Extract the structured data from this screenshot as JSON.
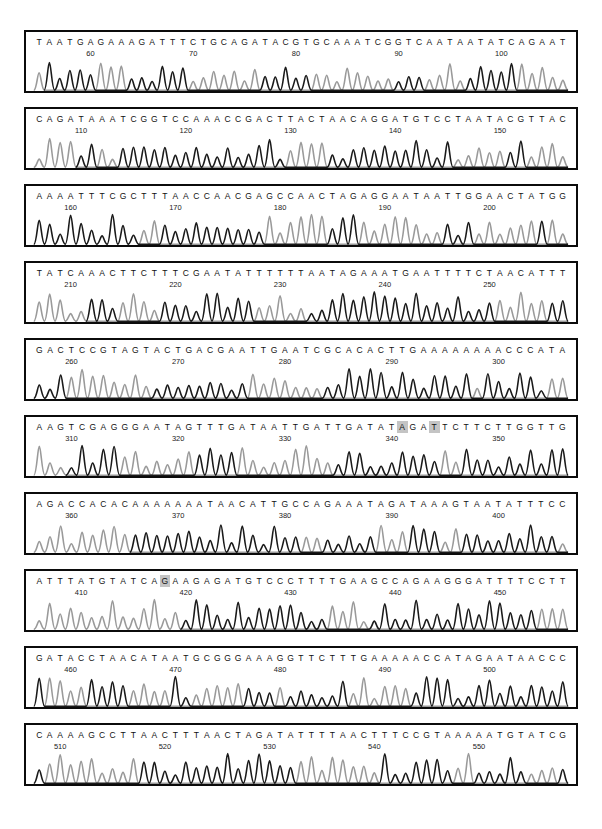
{
  "figure": {
    "type": "sanger-chromatogram",
    "panel_count": 10,
    "bases_per_panel": 51
  },
  "colors": {
    "border": "#0b0b0b",
    "background": "#ffffff",
    "trace_dark": "#1a1a1a",
    "trace_light": "#9a9a9a",
    "highlight": "#c4c4c4",
    "text": "#111111"
  },
  "panels": [
    {
      "id": "panel-1",
      "sequence": "TAATGAGAAAGATTTCTGCAGATACGTGCAAATCGGTCAATAATATCAGAAT",
      "start_position": 55,
      "ticks": [
        60,
        70,
        80,
        90,
        100
      ],
      "highlights": []
    },
    {
      "id": "panel-2",
      "sequence": "CAGATAAATCGGTCCAAACCGACTTACTAACAGGATGTCCTAATACGTTAC",
      "start_position": 106,
      "ticks": [
        110,
        120,
        130,
        140,
        150
      ],
      "highlights": []
    },
    {
      "id": "panel-3",
      "sequence": "AAAATTTCGCTTTAACCAACGAGCCAACTAGAGGAATAATTGGAACTATGG",
      "start_position": 157,
      "ticks": [
        160,
        170,
        180,
        190,
        200
      ],
      "highlights": []
    },
    {
      "id": "panel-4",
      "sequence": "TATCAAACTTCTTTCGAATATTTTTTAATAGAAATGAATTTTCTAACATTT",
      "start_position": 207,
      "ticks": [
        210,
        220,
        230,
        240,
        250
      ],
      "highlights": []
    },
    {
      "id": "panel-5",
      "sequence": "GACTCCGTAGTACTGACGAATTGAATCGCACACTTGAAAAAAAACCCATA",
      "start_position": 257,
      "ticks": [
        260,
        270,
        280,
        290,
        300
      ],
      "highlights": []
    },
    {
      "id": "panel-6",
      "sequence": "AAGTCGAGGGAATAGTTTGATAATTGATTGATATAGATTCTTCTTGGTTG",
      "start_position": 307,
      "ticks": [
        310,
        320,
        330,
        340,
        350
      ],
      "highlights": [
        34,
        37
      ]
    },
    {
      "id": "panel-7",
      "sequence": "AGACCACACAAAAAAATAACATTGCCAGAAATAGATAAAGTAATATTTCC",
      "start_position": 357,
      "ticks": [
        360,
        370,
        380,
        390,
        400
      ],
      "highlights": []
    },
    {
      "id": "panel-8",
      "sequence": "ATTTATGTATCAGAAGAGATGTCCCTTTTGAAGCCAGAAGGGATTTTCCTT",
      "start_position": 406,
      "ticks": [
        410,
        420,
        430,
        440,
        450
      ],
      "highlights": [
        12
      ]
    },
    {
      "id": "panel-9",
      "sequence": "GATACCTAACATAATGCGGGAAAGGTTCTTTGAAAAACCATAGAATAACCC",
      "start_position": 457,
      "ticks": [
        460,
        470,
        480,
        490,
        500
      ],
      "highlights": []
    },
    {
      "id": "panel-10",
      "sequence": "CAAAAGCCTTAACTTTAACTAGATATTTTAACTTTCCGTAAAAATGTATCG",
      "start_position": 508,
      "ticks": [
        510,
        520,
        530,
        540,
        550,
        560
      ],
      "highlights": []
    }
  ],
  "chart_data": {
    "type": "line",
    "title": "",
    "xlabel": "",
    "ylabel": "",
    "series": [
      {
        "name": "trace-dark",
        "color": "#1a1a1a"
      },
      {
        "name": "trace-light",
        "color": "#9a9a9a"
      }
    ],
    "panel_tick_labels": [
      [
        60,
        70,
        80,
        90,
        100
      ],
      [
        110,
        120,
        130,
        140,
        150
      ],
      [
        160,
        170,
        180,
        190,
        200
      ],
      [
        210,
        220,
        230,
        240,
        250
      ],
      [
        260,
        270,
        280,
        290,
        300
      ],
      [
        310,
        320,
        330,
        340,
        350
      ],
      [
        360,
        370,
        380,
        390,
        400
      ],
      [
        410,
        420,
        430,
        440,
        450
      ],
      [
        460,
        470,
        480,
        490,
        500
      ],
      [
        510,
        520,
        530,
        540,
        550,
        560
      ]
    ],
    "peak_heights_hint": "each base call corresponds to one fluorescence peak; peak heights vary 0.3-1.0 of panel height"
  }
}
